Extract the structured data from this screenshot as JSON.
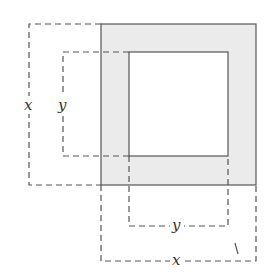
{
  "diagram": {
    "labels": {
      "left_outer": "x",
      "left_inner": "y",
      "bottom_inner": "y",
      "bottom_outer": "x"
    },
    "colors": {
      "shade": "#ebebeb",
      "stroke": "#555555",
      "dash": "#555555"
    }
  }
}
